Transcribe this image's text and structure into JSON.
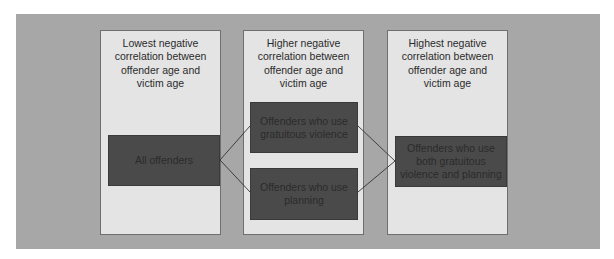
{
  "diagram": {
    "background_color": "#a7a7a7",
    "panel_color": "#e4e4e4",
    "box_color": "#4a4a4a",
    "panels": [
      {
        "title": "Lowest negative correlation between offender age and victim age",
        "title_lines": [
          "Lowest negative",
          "correlation between",
          "offender age and",
          "victim age"
        ],
        "boxes": [
          {
            "label_lines": [
              "All offenders"
            ]
          }
        ]
      },
      {
        "title": "Higher negative correlation between offender age and victim age",
        "title_lines": [
          "Higher negative",
          "correlation between",
          "offender age and",
          "victim age"
        ],
        "boxes": [
          {
            "label_lines": [
              "Offenders who use",
              "gratuitous violence"
            ]
          },
          {
            "label_lines": [
              "Offenders who use",
              "planning"
            ]
          }
        ]
      },
      {
        "title": "Highest negative correlation between offender age and victim age",
        "title_lines": [
          "Highest negative",
          "correlation between",
          "offender age and",
          "victim age"
        ],
        "boxes": [
          {
            "label_lines": [
              "Offenders who use",
              "both gratuitous",
              "violence and planning"
            ]
          }
        ]
      }
    ],
    "connections": [
      {
        "from": "All offenders",
        "to": "Offenders who use gratuitous violence"
      },
      {
        "from": "All offenders",
        "to": "Offenders who use planning"
      },
      {
        "from": "Offenders who use gratuitous violence",
        "to": "Offenders who use both gratuitous violence and planning"
      },
      {
        "from": "Offenders who use planning",
        "to": "Offenders who use both gratuitous violence and planning"
      }
    ]
  }
}
